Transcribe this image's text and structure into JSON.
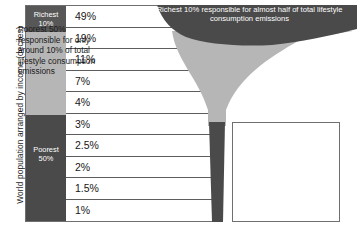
{
  "axis": {
    "y_caption": "World population arranged by income (deciles)"
  },
  "labels": {
    "richest": "Richest\n10%",
    "richest_line1": "Richest",
    "richest_line2": "10%",
    "poorest_line1": "Poorest",
    "poorest_line2": "50%"
  },
  "annotations": {
    "top": "Richest 10% responsible for almost half of total lifestyle consumption emissions",
    "bottom": "Poorest 50% responsible for only around 10% of total lifestyle consumption emissions"
  },
  "colors": {
    "dark_band": "#4a4a4a",
    "funnel_light": "#b6b6b6",
    "funnel_stem": "#4a4a4a",
    "label_dark": "#575757",
    "label_mid": "#b6b6b6",
    "frame": "#6f6f6f",
    "text": "#1b1b1b",
    "background": "#ffffff"
  },
  "chart_data": {
    "type": "bar",
    "title": "",
    "xlabel": "",
    "ylabel": "World population arranged by income (deciles)",
    "categories": [
      "Decile 1 (Richest 10%)",
      "Decile 2",
      "Decile 3",
      "Decile 4",
      "Decile 5",
      "Decile 6",
      "Decile 7",
      "Decile 8",
      "Decile 9",
      "Decile 10 (Poorest)"
    ],
    "values": [
      49,
      19,
      11,
      7,
      4,
      3,
      2.5,
      2,
      1.5,
      1
    ],
    "value_labels": [
      "49%",
      "19%",
      "11%",
      "7%",
      "4%",
      "3%",
      "2.5%",
      "2%",
      "1.5%",
      "1%"
    ],
    "unit": "%",
    "ylim": [
      0,
      49
    ],
    "grid": true,
    "legend": "none",
    "notes": [
      "Richest 10% responsible for almost half of total lifestyle consumption emissions",
      "Poorest 50% responsible for only around 10% of total lifestyle consumption emissions"
    ],
    "groups": [
      {
        "name": "Richest 10%",
        "deciles": [
          1
        ],
        "share": 49
      },
      {
        "name": "Poorest 50%",
        "deciles": [
          6,
          7,
          8,
          9,
          10
        ],
        "share": 10
      }
    ]
  }
}
